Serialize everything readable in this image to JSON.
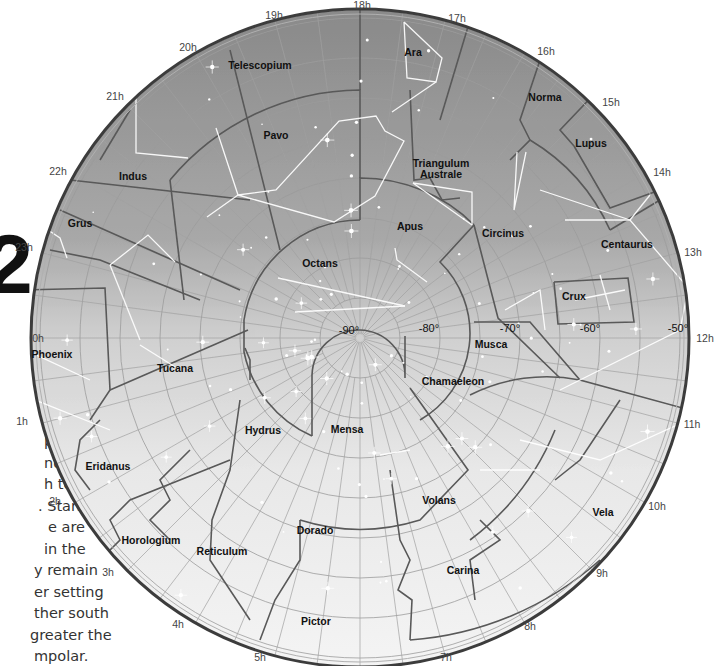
{
  "map": {
    "title": "Southern Polar Star Chart",
    "center": {
      "x": 360,
      "y": 338
    },
    "radius": 330,
    "colors": {
      "sky_top": "#8e8e8e",
      "sky_mid": "#c4c4c4",
      "sky_bottom": "#f2f2f2",
      "boundary": "#5a5a5a",
      "grid": "#9a9a9a",
      "rim": "#3a3a3a",
      "stick_figure": "#ffffff"
    },
    "hour_labels": [
      {
        "label": "0h",
        "x": 38,
        "y": 342
      },
      {
        "label": "1h",
        "x": 22,
        "y": 425
      },
      {
        "label": "2h",
        "x": 55,
        "y": 505
      },
      {
        "label": "3h",
        "x": 108,
        "y": 576
      },
      {
        "label": "4h",
        "x": 178,
        "y": 628
      },
      {
        "label": "5h",
        "x": 260,
        "y": 661
      },
      {
        "label": "7h",
        "x": 446,
        "y": 661
      },
      {
        "label": "8h",
        "x": 530,
        "y": 630
      },
      {
        "label": "9h",
        "x": 602,
        "y": 577
      },
      {
        "label": "10h",
        "x": 657,
        "y": 510
      },
      {
        "label": "11h",
        "x": 692,
        "y": 428
      },
      {
        "label": "12h",
        "x": 705,
        "y": 342
      },
      {
        "label": "13h",
        "x": 693,
        "y": 256
      },
      {
        "label": "14h",
        "x": 662,
        "y": 176
      },
      {
        "label": "15h",
        "x": 611,
        "y": 106
      },
      {
        "label": "16h",
        "x": 546,
        "y": 55
      },
      {
        "label": "17h",
        "x": 457,
        "y": 22
      },
      {
        "label": "18h",
        "x": 362,
        "y": 9
      },
      {
        "label": "19h",
        "x": 274,
        "y": 19
      },
      {
        "label": "20h",
        "x": 188,
        "y": 51
      },
      {
        "label": "21h",
        "x": 115,
        "y": 100
      },
      {
        "label": "22h",
        "x": 58,
        "y": 175
      },
      {
        "label": "23h",
        "x": 24,
        "y": 251
      }
    ],
    "declination_labels": [
      {
        "label": "-90°",
        "x": 349,
        "y": 334
      },
      {
        "label": "-80°",
        "x": 429,
        "y": 332
      },
      {
        "label": "-70°",
        "x": 510,
        "y": 332
      },
      {
        "label": "-60°",
        "x": 590,
        "y": 332
      },
      {
        "label": "-50°",
        "x": 678,
        "y": 332
      }
    ],
    "constellations": [
      {
        "name": "Ara",
        "x": 413,
        "y": 56
      },
      {
        "name": "Telescopium",
        "x": 260,
        "y": 69
      },
      {
        "name": "Norma",
        "x": 545,
        "y": 101
      },
      {
        "name": "Pavo",
        "x": 276,
        "y": 139
      },
      {
        "name": "Lupus",
        "x": 591,
        "y": 147
      },
      {
        "name": "Indus",
        "x": 133,
        "y": 180
      },
      {
        "name": "Triangulum",
        "x": 441,
        "y": 167
      },
      {
        "name": "Australe",
        "x": 441,
        "y": 178
      },
      {
        "name": "Grus",
        "x": 80,
        "y": 227
      },
      {
        "name": "Apus",
        "x": 410,
        "y": 230
      },
      {
        "name": "Circinus",
        "x": 503,
        "y": 237
      },
      {
        "name": "Centaurus",
        "x": 627,
        "y": 248
      },
      {
        "name": "Octans",
        "x": 320,
        "y": 267
      },
      {
        "name": "Crux",
        "x": 574,
        "y": 300
      },
      {
        "name": "Phoenix",
        "x": 52,
        "y": 358
      },
      {
        "name": "Musca",
        "x": 491,
        "y": 348
      },
      {
        "name": "Tucana",
        "x": 175,
        "y": 372
      },
      {
        "name": "Chamaeleon",
        "x": 453,
        "y": 385
      },
      {
        "name": "Hydrus",
        "x": 263,
        "y": 434
      },
      {
        "name": "Mensa",
        "x": 347,
        "y": 433
      },
      {
        "name": "Eridanus",
        "x": 108,
        "y": 470
      },
      {
        "name": "Volans",
        "x": 439,
        "y": 504
      },
      {
        "name": "Dorado",
        "x": 315,
        "y": 534
      },
      {
        "name": "Horologium",
        "x": 151,
        "y": 544
      },
      {
        "name": "Reticulum",
        "x": 222,
        "y": 555
      },
      {
        "name": "Vela",
        "x": 603,
        "y": 516
      },
      {
        "name": "Carina",
        "x": 463,
        "y": 574
      },
      {
        "name": "Pictor",
        "x": 316,
        "y": 625
      }
    ]
  },
  "sidebar": {
    "big_numeral": "2",
    "text_lines": [
      "e,",
      "",
      "pole",
      "nd",
      "h to",
      ". Stars",
      "e are",
      "in the",
      "y remain",
      "er setting",
      "ther south",
      "greater the",
      "mpolar."
    ]
  }
}
